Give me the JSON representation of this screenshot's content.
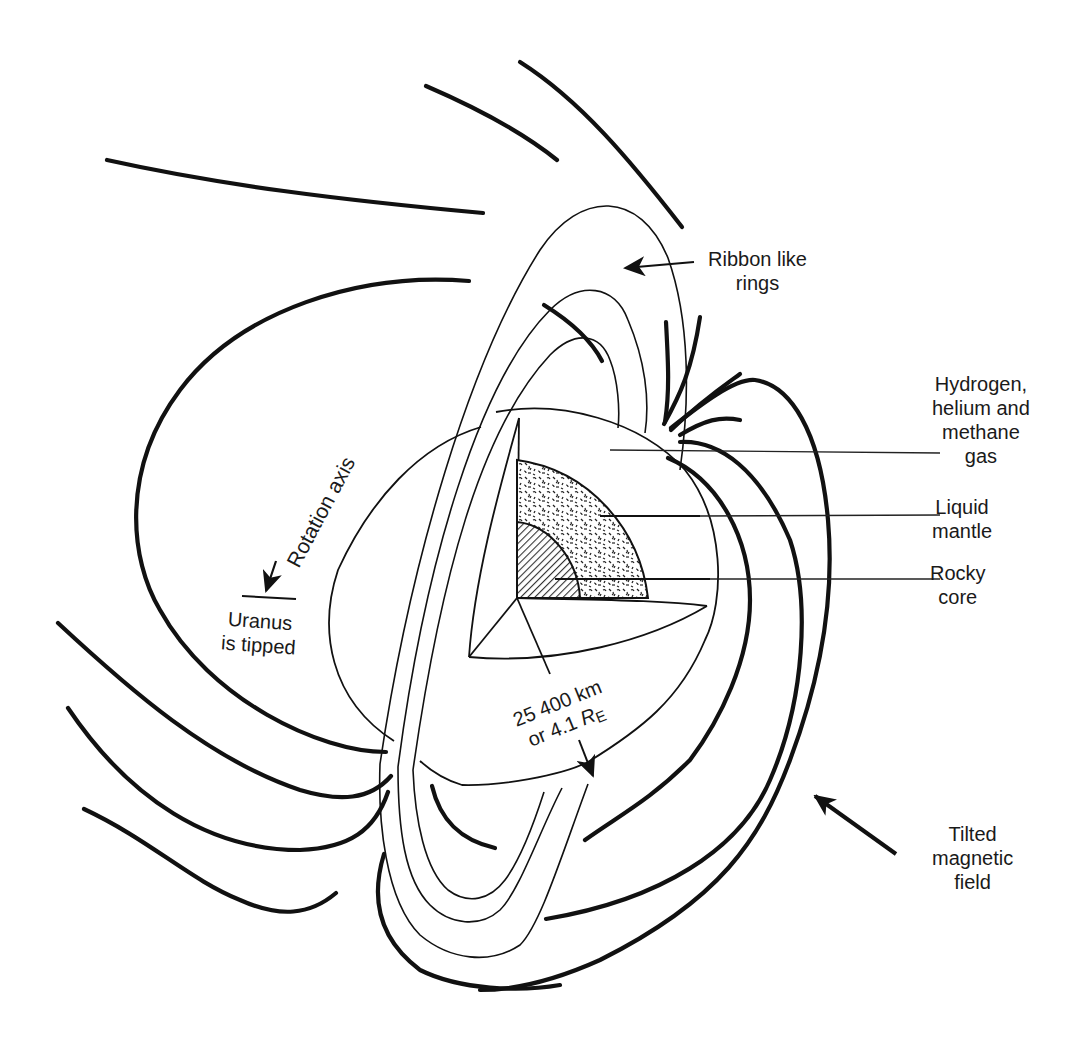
{
  "figure": {
    "colors": {
      "ink": "#111111",
      "background": "#ffffff",
      "core_hatch": "#555555"
    }
  },
  "labels": {
    "rings": {
      "line1": "Ribbon like",
      "line2": "rings"
    },
    "atmosphere": {
      "line1": "Hydrogen,",
      "line2": "helium and",
      "line3": "methane",
      "line4": "gas"
    },
    "mantle": {
      "line1": "Liquid",
      "line2": "mantle"
    },
    "core": {
      "line1": "Rocky",
      "line2": "core"
    },
    "rotation_axis": "Rotation axis",
    "tipped": {
      "line1": "Uranus",
      "line2": "is tipped"
    },
    "radius": {
      "line1": "25 400 km",
      "line2_prefix": "or 4.1 ",
      "line2_symbol": "R",
      "line2_subscript": "E"
    },
    "magnetic": {
      "line1": "Tilted",
      "line2": "magnetic",
      "line3": "field"
    }
  },
  "icons": {
    "rings_arrow": "arrow-left-icon",
    "rotation_arrow": "arrow-down-icon",
    "radius_arrow": "arrow-down-icon",
    "magnetic_arrow": "arrow-up-left-icon"
  }
}
